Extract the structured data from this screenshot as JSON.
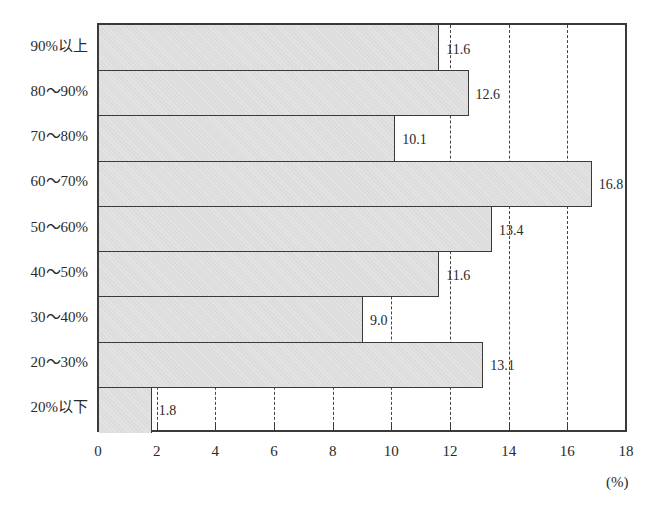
{
  "chart_data": {
    "type": "bar",
    "orientation": "horizontal",
    "title": "",
    "categories": [
      "90%以上",
      "80～90%",
      "70～80%",
      "60～70%",
      "50～60%",
      "40～50%",
      "30～40%",
      "20～30%",
      "20%以下"
    ],
    "values": [
      11.6,
      12.6,
      10.1,
      16.8,
      13.4,
      11.6,
      9.0,
      13.1,
      1.8
    ],
    "value_labels": [
      "11.6",
      "12.6",
      "10.1",
      "16.8",
      "13.4",
      "11.6",
      "9.0",
      "13.1",
      "1.8"
    ],
    "xlabel": "(%)",
    "ylabel": "",
    "xlim": [
      0,
      18
    ],
    "xticks": [
      0,
      2,
      4,
      6,
      8,
      10,
      12,
      14,
      16,
      18
    ],
    "xtick_labels": [
      "0",
      "2",
      "4",
      "6",
      "8",
      "10",
      "12",
      "14",
      "16",
      "18"
    ],
    "grid": {
      "vertical_dashed_at": [
        2,
        4,
        6,
        8,
        10,
        12,
        14,
        16
      ]
    },
    "legend": null,
    "colors": {
      "bar_fill": "#dcdcdc",
      "bar_edge": "#3a3a3a",
      "grid": "#444444"
    }
  }
}
